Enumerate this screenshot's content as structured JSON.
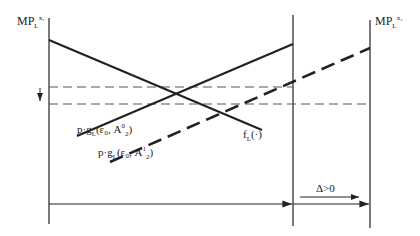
{
  "diagram": {
    "labels": {
      "left_axis": {
        "main": "MP",
        "sub": "L",
        "sup": "x₁"
      },
      "right_axis": {
        "main": "MP",
        "sub": "L",
        "sup": "x₂"
      },
      "curve_solid": {
        "pre": "p·g",
        "sub": "L",
        "mid": "(ε₀, A",
        "sup": "0",
        "sub2": "2",
        "post": ")"
      },
      "curve_dashed": {
        "pre": "p·g",
        "sub": "L",
        "mid": "(ε₀, A",
        "sup": "1",
        "sub2": "2",
        "post": ")"
      },
      "curve_f": {
        "pre": "f",
        "sub": "L",
        "post": "(·)"
      },
      "delta": "Δ>0"
    },
    "colors": {
      "line": "#222222",
      "dash": "#555555"
    }
  }
}
